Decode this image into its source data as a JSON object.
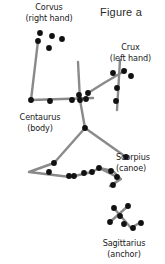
{
  "figure": {
    "caption": "Figure a",
    "background_color": "#ffffff",
    "line_color": "#8a8a8a",
    "star_color": "#111111",
    "text_color": "#1a1a1a"
  },
  "constellations": [
    {
      "key": "corvus",
      "name": "Corvus",
      "role": "(right hand)",
      "stars": [
        {
          "x": 40,
          "y": 33
        },
        {
          "x": 52,
          "y": 36
        },
        {
          "x": 62,
          "y": 39
        },
        {
          "x": 49,
          "y": 48
        },
        {
          "x": 38,
          "y": 41
        }
      ],
      "lines": [
        {
          "points": "38,41 31,100"
        }
      ]
    },
    {
      "key": "crux",
      "name": "Crux",
      "role": "(left hand)",
      "stars": [
        {
          "x": 113,
          "y": 73
        },
        {
          "x": 124,
          "y": 71
        },
        {
          "x": 131,
          "y": 76
        },
        {
          "x": 117,
          "y": 88
        },
        {
          "x": 116,
          "y": 101
        }
      ],
      "lines": [
        {
          "points": "120,60 117,110"
        },
        {
          "points": "88,93 104,83 126,70"
        }
      ]
    },
    {
      "key": "centaurus",
      "name": "Centaurus",
      "role": "(body)",
      "stars": [
        {
          "x": 31,
          "y": 100
        },
        {
          "x": 50,
          "y": 101
        },
        {
          "x": 72,
          "y": 100
        },
        {
          "x": 79,
          "y": 95
        },
        {
          "x": 80,
          "y": 100
        },
        {
          "x": 86,
          "y": 99
        },
        {
          "x": 88,
          "y": 93
        }
      ],
      "lines": [
        {
          "points": "31,100 93,98"
        },
        {
          "points": "78,62 80,100 85,128"
        }
      ]
    },
    {
      "key": "scorpius",
      "name": "Scorpius",
      "role": "(canoe)",
      "stars": [
        {
          "x": 85,
          "y": 128
        },
        {
          "x": 54,
          "y": 163
        },
        {
          "x": 49,
          "y": 172
        },
        {
          "x": 69,
          "y": 176
        },
        {
          "x": 74,
          "y": 176
        },
        {
          "x": 84,
          "y": 173
        },
        {
          "x": 92,
          "y": 172
        },
        {
          "x": 99,
          "y": 168
        },
        {
          "x": 111,
          "y": 171
        },
        {
          "x": 117,
          "y": 177
        },
        {
          "x": 113,
          "y": 185
        },
        {
          "x": 126,
          "y": 157
        }
      ],
      "lines": [
        {
          "points": "85,128 54,163 29,172 70,177 92,172 99,168 113,171 120,178 112,186"
        },
        {
          "points": "85,128 126,157"
        },
        {
          "points": "99,168 121,179 110,186"
        }
      ]
    },
    {
      "key": "sagittarius",
      "name": "Sagittarius",
      "role": "(anchor)",
      "stars": [
        {
          "x": 114,
          "y": 208
        },
        {
          "x": 128,
          "y": 206
        },
        {
          "x": 120,
          "y": 216
        },
        {
          "x": 110,
          "y": 222
        },
        {
          "x": 124,
          "y": 224
        },
        {
          "x": 133,
          "y": 228
        },
        {
          "x": 141,
          "y": 223
        }
      ],
      "lines": [
        {
          "points": "113,207 131,228 141,222"
        },
        {
          "points": "128,206 110,222"
        }
      ]
    }
  ]
}
